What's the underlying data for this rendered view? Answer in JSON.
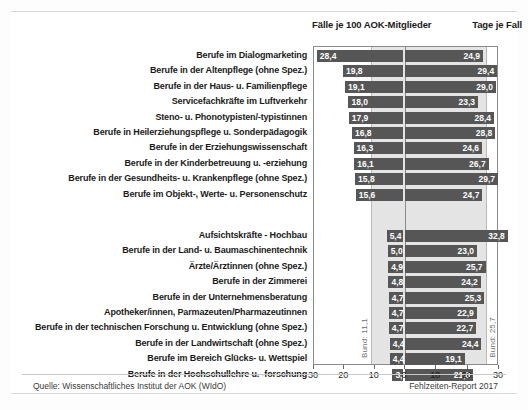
{
  "header": {
    "left_title": "Fälle je 100 AOK-Mitglieder",
    "right_title": "Tage je Fall"
  },
  "footer": {
    "source": "Quelle: Wissenschaftliches Institut der AOK (WIdO)",
    "report": "Fehlzeiten-Report 2017"
  },
  "reference": {
    "left_label": "Bund: 11,1",
    "right_label": "Bund: 25,7",
    "left_value": 11.1,
    "right_value": 25.7
  },
  "chart_data": {
    "type": "bar",
    "title": "",
    "subtitle": "",
    "orientation": "horizontal-diverging",
    "xlabel": "",
    "ylabel": "",
    "axis_left": {
      "label": "Fälle je 100 AOK-Mitglieder",
      "ticks": [
        30,
        20,
        10,
        0
      ],
      "range": [
        30,
        0
      ],
      "reference_line": 11.1,
      "reference_label": "Bund: 11,1"
    },
    "axis_right": {
      "label": "Tage je Fall",
      "ticks": [
        0,
        10,
        20,
        30
      ],
      "range": [
        0,
        30
      ],
      "reference_line": 25.7,
      "reference_label": "Bund: 25,7"
    },
    "grid": false,
    "legend": "none",
    "bar_color": "#565656",
    "band_color": "#e4e4e4",
    "groups": [
      {
        "name": "top",
        "categories": [
          "Berufe im Dialogmarketing",
          "Berufe in der Altenpflege (ohne Spez.)",
          "Berufe in der Haus- u. Familienpflege",
          "Servicefachkräfte im Luftverkehr",
          "Steno- u. Phonotypisten/-typistinnen",
          "Berufe in Heilerziehungspflege u. Sonderpädagogik",
          "Berufe in der Erziehungswissenschaft",
          "Berufe in der Kinderbetreuung u. -erziehung",
          "Berufe in der Gesundheits- u. Krankenpflege (ohne Spez.)",
          "Berufe im Objekt-, Werte- u. Personenschutz"
        ],
        "faelle": [
          28.4,
          19.8,
          19.1,
          18.0,
          17.9,
          16.8,
          16.3,
          16.1,
          15.8,
          15.6
        ],
        "faelle_labels": [
          "28,4",
          "19,8",
          "19,1",
          "18,0",
          "17,9",
          "16,8",
          "16,3",
          "16,1",
          "15,8",
          "15,6"
        ],
        "tage": [
          24.9,
          29.4,
          29.0,
          23.3,
          28.4,
          28.8,
          24.6,
          26.7,
          29.7,
          24.7
        ],
        "tage_labels": [
          "24,9",
          "29,4",
          "29,0",
          "23,3",
          "28,4",
          "28,8",
          "24,6",
          "26,7",
          "29,7",
          "24,7"
        ]
      },
      {
        "name": "bottom",
        "categories": [
          "Aufsichtskräfte - Hochbau",
          "Berufe in der Land- u. Baumaschinentechnik",
          "Ärzte/Ärztinnen (ohne Spez.)",
          "Berufe in der Zimmerei",
          "Berufe in der Unternehmensberatung",
          "Apotheker/innen, Parmazeuten/Pharmazeutinnen",
          "Berufe in der technischen Forschung u. Entwicklung (ohne Spez.)",
          "Berufe in der Landwirtschaft (ohne Spez.)",
          "Berufe im Bereich Glücks- u. Wettspiel",
          "Berufe in der Hochschullehre u. -forschung"
        ],
        "faelle": [
          5.4,
          5.0,
          4.9,
          4.8,
          4.7,
          4.7,
          4.7,
          4.4,
          4.4,
          3.5
        ],
        "faelle_labels": [
          "5,4",
          "5,0",
          "4,9",
          "4,8",
          "4,7",
          "4,7",
          "4,7",
          "4,4",
          "4,4",
          "3,5"
        ],
        "tage": [
          32.8,
          23.0,
          25.7,
          24.2,
          25.3,
          22.9,
          22.7,
          24.4,
          19.1,
          21.8
        ],
        "tage_labels": [
          "32,8",
          "23,0",
          "25,7",
          "24,2",
          "25,3",
          "22,9",
          "22,7",
          "24,4",
          "19,1",
          "21,8"
        ]
      }
    ]
  }
}
